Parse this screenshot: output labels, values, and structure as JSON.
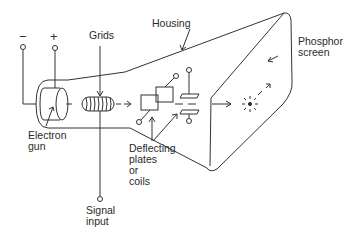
{
  "diagram": {
    "terminals": {
      "negative": "−",
      "positive": "+"
    },
    "labels": {
      "grids": "Grids",
      "housing": "Housing",
      "phosphor_screen": "Phosphor\nscreen",
      "electron_gun": "Electron\ngun",
      "deflecting": "Deflecting\nplates\nor\ncoils",
      "signal_input": "Signal\ninput"
    },
    "colors": {
      "line": "#333333",
      "background": "#ffffff"
    }
  }
}
